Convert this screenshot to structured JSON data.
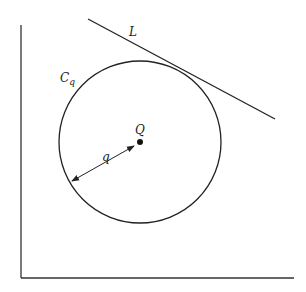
{
  "diagram": {
    "labels": {
      "line": "L",
      "circle_main": "C",
      "circle_sub": "q",
      "center": "Q",
      "radius": "q"
    },
    "elements": {
      "circle": {
        "cx": 140,
        "cy": 142,
        "r": 81
      },
      "tangent_line": {
        "x1": 88,
        "y1": 19,
        "x2": 275,
        "y2": 119
      },
      "radius_arrow": {
        "x1": 71,
        "y1": 181,
        "x2": 135,
        "y2": 145
      },
      "axes": {
        "origin_x": 21,
        "origin_y": 278,
        "top_y": 25,
        "right_x": 294
      }
    },
    "stroke_color": "#222222"
  }
}
